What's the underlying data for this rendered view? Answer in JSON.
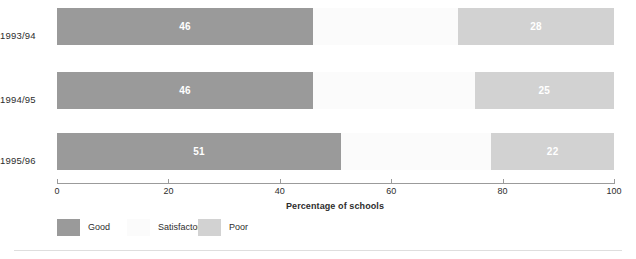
{
  "chart_data": {
    "type": "bar",
    "orientation": "horizontal",
    "stacked": true,
    "stacked_normalized_percent": true,
    "title": "",
    "xlabel": "Percentage of schools",
    "ylabel": "",
    "xlim": [
      0,
      100
    ],
    "xticks": [
      0,
      20,
      40,
      60,
      80,
      100
    ],
    "xtick_labels": [
      "0",
      "20",
      "40",
      "60",
      "80",
      "100"
    ],
    "grid": false,
    "legend_position": "bottom-left",
    "categories": [
      "1993/94",
      "1994/95",
      "1995/96"
    ],
    "series": [
      {
        "name": "Good",
        "color": "#9a9a9a",
        "values": [
          46,
          46,
          51
        ],
        "value_labels": [
          "46",
          "46",
          "51"
        ]
      },
      {
        "name": "Satisfactory",
        "color": "#fbfbfb",
        "values": [
          26,
          29,
          27
        ],
        "value_labels": [
          "",
          "",
          ""
        ]
      },
      {
        "name": "Poor",
        "color": "#d2d2d2",
        "values": [
          28,
          25,
          22
        ],
        "value_labels": [
          "28",
          "25",
          "22"
        ]
      }
    ]
  },
  "axis": {
    "x_title": "Percentage of schools",
    "ticks": [
      {
        "value": 0,
        "label": "0"
      },
      {
        "value": 20,
        "label": "20"
      },
      {
        "value": 40,
        "label": "40"
      },
      {
        "value": 60,
        "label": "60"
      },
      {
        "value": 80,
        "label": "80"
      },
      {
        "value": 100,
        "label": "100"
      }
    ],
    "categories": [
      {
        "label": "1993/94"
      },
      {
        "label": "1994/95"
      },
      {
        "label": "1995/96"
      }
    ]
  },
  "legend": {
    "items": [
      {
        "label": "Good",
        "color": "#9a9a9a"
      },
      {
        "label": "Satisfactory",
        "color": "#fbfbfb"
      },
      {
        "label": "Poor",
        "color": "#d2d2d2"
      }
    ]
  },
  "bars": [
    {
      "category": "1993/94",
      "segments": [
        {
          "series": "Good",
          "value": 46,
          "label": "46",
          "start": 0,
          "end": 46
        },
        {
          "series": "Satisfactory",
          "value": 26,
          "label": "",
          "start": 46,
          "end": 72
        },
        {
          "series": "Poor",
          "value": 28,
          "label": "28",
          "start": 72,
          "end": 100
        }
      ]
    },
    {
      "category": "1994/95",
      "segments": [
        {
          "series": "Good",
          "value": 46,
          "label": "46",
          "start": 0,
          "end": 46
        },
        {
          "series": "Satisfactory",
          "value": 29,
          "label": "",
          "start": 46,
          "end": 75
        },
        {
          "series": "Poor",
          "value": 25,
          "label": "25",
          "start": 75,
          "end": 100
        }
      ]
    },
    {
      "category": "1995/96",
      "segments": [
        {
          "series": "Good",
          "value": 51,
          "label": "51",
          "start": 0,
          "end": 51
        },
        {
          "series": "Satisfactory",
          "value": 27,
          "label": "",
          "start": 51,
          "end": 78
        },
        {
          "series": "Poor",
          "value": 22,
          "label": "22",
          "start": 78,
          "end": 100
        }
      ]
    }
  ]
}
